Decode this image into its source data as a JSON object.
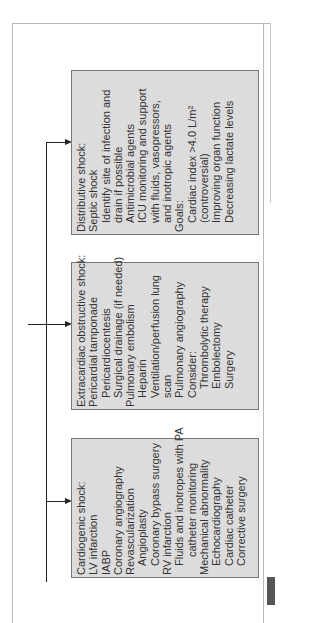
{
  "diagram": {
    "orientation": "rotated-90-ccw",
    "boxes": [
      {
        "id": "distributive",
        "title": "Distributive shock:",
        "lines": [
          {
            "text": "Septic shock",
            "indent": 0
          },
          {
            "text": "Identify site of infection and",
            "indent": 1
          },
          {
            "text": "drain if possible",
            "indent": 1
          },
          {
            "text": "Antimicrobial agents",
            "indent": 1
          },
          {
            "text": "ICU monitoring and support",
            "indent": 1
          },
          {
            "text": "with fluids, vasopressors,",
            "indent": 1
          },
          {
            "text": "and inotropic agents",
            "indent": 1
          },
          {
            "text": "Goals:",
            "indent": 0
          },
          {
            "text": "Cardiac index >4.0 L/m²",
            "indent": 1
          },
          {
            "text": "(controversial)",
            "indent": 1
          },
          {
            "text": "Improving organ function",
            "indent": 1
          },
          {
            "text": "Decreasing lactate levels",
            "indent": 1
          }
        ]
      },
      {
        "id": "extracardiac",
        "title": "Extracardiac obstructive shock:",
        "lines": [
          {
            "text": "Pericardial tamponade",
            "indent": 0
          },
          {
            "text": "Pericardiocentesis",
            "indent": 1
          },
          {
            "text": "Surgical drainage (if needed)",
            "indent": 1
          },
          {
            "text": "Pulmonary embolism",
            "indent": 0
          },
          {
            "text": "Heparin",
            "indent": 1
          },
          {
            "text": "Ventilation/perfusion lung",
            "indent": 1
          },
          {
            "text": "scan",
            "indent": 1
          },
          {
            "text": "Pulmonary angiography",
            "indent": 1
          },
          {
            "text": "Consider:",
            "indent": 1
          },
          {
            "text": "Thrombolytic therapy",
            "indent": 2
          },
          {
            "text": "Embolectomy",
            "indent": 2
          },
          {
            "text": "Surgery",
            "indent": 2
          }
        ]
      },
      {
        "id": "cardiogenic",
        "title": "Cardiogenic shock:",
        "lines": [
          {
            "text": "LV infarction",
            "indent": 0
          },
          {
            "text": "IABP",
            "indent": 0
          },
          {
            "text": "Coronary angiography",
            "indent": 0
          },
          {
            "text": "Revascularization",
            "indent": 0
          },
          {
            "text": "Angioplasty",
            "indent": 1
          },
          {
            "text": "Coronary bypass surgery",
            "indent": 1
          },
          {
            "text": "RV infarction",
            "indent": 0
          },
          {
            "text": "Fluids and inotropes with PA",
            "indent": 1
          },
          {
            "text": "catheter monitoring",
            "indent": 2
          },
          {
            "text": "Mechanical abnormality",
            "indent": 0
          },
          {
            "text": "Echocardiography",
            "indent": 1
          },
          {
            "text": "Cardiac catheter",
            "indent": 1
          },
          {
            "text": "Corrective surgery",
            "indent": 1
          }
        ]
      }
    ],
    "colors": {
      "box_fill": "#dcdcdc",
      "box_border": "#777777",
      "line": "#222222",
      "frame": "#b8b8b8",
      "tab": "#555555"
    }
  }
}
